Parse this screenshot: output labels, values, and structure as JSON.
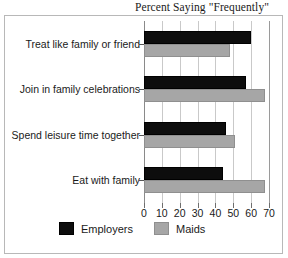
{
  "chart_data": {
    "type": "bar",
    "orientation": "horizontal",
    "title": "Percent Saying \"Frequently\"",
    "xlabel": "",
    "ylabel": "",
    "xlim": [
      0,
      70
    ],
    "xticks": [
      0,
      10,
      20,
      30,
      40,
      50,
      60,
      70
    ],
    "xtick_labels": [
      "0",
      "10",
      "20",
      "30",
      "40",
      "50",
      "60",
      "70"
    ],
    "grid": true,
    "grid_axis": "x",
    "legend_position": "bottom-center",
    "categories": [
      "Treat like family or friend",
      "Join in family celebrations",
      "Spend leisure time together",
      "Eat with family"
    ],
    "series": [
      {
        "name": "Employers",
        "color": "#0d0d0d",
        "values": [
          60,
          57,
          46,
          44
        ]
      },
      {
        "name": "Maids",
        "color": "#a6a6a6",
        "values": [
          48,
          68,
          51,
          68
        ]
      }
    ]
  },
  "legend": {
    "items": [
      {
        "label": "Employers",
        "swatch": "employers"
      },
      {
        "label": "Maids",
        "swatch": "maids"
      }
    ]
  }
}
